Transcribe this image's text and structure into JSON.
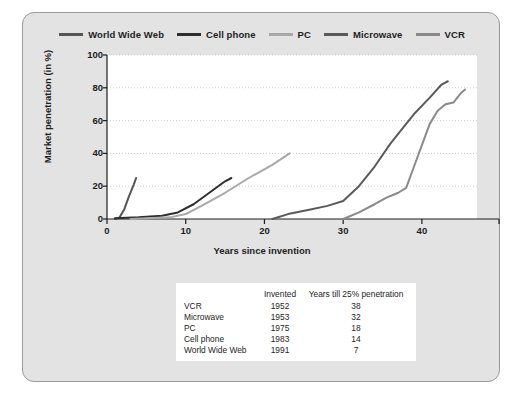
{
  "chart_data": {
    "type": "line",
    "title": "",
    "xlabel": "Years since invention",
    "ylabel": "Market penetration (in %)",
    "xlim": [
      0,
      47
    ],
    "ylim": [
      0,
      100
    ],
    "xticks": [
      0,
      10,
      20,
      30,
      40
    ],
    "yticks": [
      0,
      20,
      40,
      60,
      80,
      100
    ],
    "grid": true,
    "legend_position": "top",
    "series": [
      {
        "name": "World Wide Web",
        "color": "#555555",
        "points": [
          [
            1,
            0
          ],
          [
            1.6,
            1
          ],
          [
            2.2,
            6
          ],
          [
            2.8,
            14
          ],
          [
            3.4,
            21
          ],
          [
            3.7,
            25
          ]
        ]
      },
      {
        "name": "Cell phone",
        "color": "#2e2e2e",
        "points": [
          [
            1,
            0.5
          ],
          [
            4,
            1
          ],
          [
            7,
            2
          ],
          [
            9,
            4
          ],
          [
            11,
            9
          ],
          [
            13,
            16
          ],
          [
            15,
            23
          ],
          [
            15.8,
            25
          ]
        ]
      },
      {
        "name": "PC",
        "color": "#a8a8a8",
        "points": [
          [
            3,
            0
          ],
          [
            8,
            1
          ],
          [
            10,
            3
          ],
          [
            12,
            8
          ],
          [
            15,
            16
          ],
          [
            18,
            25
          ],
          [
            21,
            33
          ],
          [
            23.2,
            40
          ]
        ]
      },
      {
        "name": "Microwave",
        "color": "#5a5a5a",
        "points": [
          [
            21,
            0
          ],
          [
            23,
            3
          ],
          [
            26,
            6
          ],
          [
            28,
            8
          ],
          [
            30,
            11
          ],
          [
            32,
            20
          ],
          [
            34,
            32
          ],
          [
            36,
            46
          ],
          [
            38,
            58
          ],
          [
            39,
            64
          ],
          [
            41,
            74
          ],
          [
            42.5,
            82
          ],
          [
            43.3,
            84
          ]
        ]
      },
      {
        "name": "VCR",
        "color": "#8a8a8a",
        "points": [
          [
            30,
            0
          ],
          [
            32,
            4
          ],
          [
            34,
            9
          ],
          [
            35.5,
            13
          ],
          [
            37,
            16
          ],
          [
            38,
            19
          ],
          [
            39,
            32
          ],
          [
            40,
            45
          ],
          [
            41,
            58
          ],
          [
            42,
            66
          ],
          [
            43,
            70
          ],
          [
            44,
            71
          ],
          [
            45,
            77
          ],
          [
            45.5,
            79
          ]
        ]
      }
    ],
    "table": {
      "columns": [
        "",
        "Invented",
        "Years till 25% penetration"
      ],
      "rows": [
        [
          "VCR",
          "1952",
          "38"
        ],
        [
          "Microwave",
          "1953",
          "32"
        ],
        [
          "PC",
          "1975",
          "18"
        ],
        [
          "Cell phone",
          "1983",
          "14"
        ],
        [
          "World Wide Web",
          "1991",
          "7"
        ]
      ]
    }
  },
  "colors": {
    "panel_background": "#e3e3e3",
    "panel_border": "#9a9a9a",
    "plot_background": "#ffffff",
    "grid": "#cccccc",
    "axis": "#1d1d1d",
    "text": "#1d1d1d"
  }
}
